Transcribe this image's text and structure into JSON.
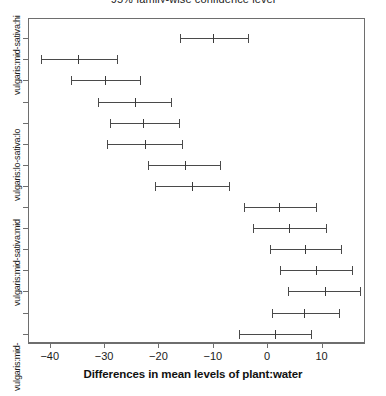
{
  "chart_data": {
    "type": "bar",
    "subtype": "tukey-hsd-confidence-intervals",
    "title": "95% family-wise confidence level",
    "xlabel": "Differences in mean levels of plant:water",
    "ylabel": "",
    "xlim": [
      -44,
      18
    ],
    "xticks": [
      -40,
      -30,
      -20,
      -10,
      0,
      10
    ],
    "xticklabels": [
      "-40",
      "-30",
      "-20",
      "-10",
      "0",
      "10"
    ],
    "grid": false,
    "legend": null,
    "orientation": "horizontal",
    "reference_line": null,
    "n_rows": 15,
    "categories": [
      "vulgaris:mid-sativa:hi",
      "",
      "",
      "",
      "",
      "vulgaris:lo-sativa:lo",
      "",
      "",
      "",
      "",
      "vulgaris:mid-sativa:mid",
      "",
      "",
      "",
      "vulgaris:mid-"
    ],
    "rows": [
      {
        "label": "vulgaris:mid-sativa:hi",
        "lower": -16.0,
        "center": -9.9,
        "upper": -3.5
      },
      {
        "label": "",
        "lower": -41.6,
        "center": -34.8,
        "upper": -27.7
      },
      {
        "label": "",
        "lower": -36.0,
        "center": -29.8,
        "upper": -23.4
      },
      {
        "label": "",
        "lower": -31.2,
        "center": -24.3,
        "upper": -17.7
      },
      {
        "label": "",
        "lower": -28.9,
        "center": -22.9,
        "upper": -16.3
      },
      {
        "label": "vulgaris:lo-sativa:lo",
        "lower": -29.4,
        "center": -22.4,
        "upper": -15.7
      },
      {
        "label": "",
        "lower": -21.9,
        "center": -15.1,
        "upper": -8.6
      },
      {
        "label": "",
        "lower": -20.7,
        "center": -13.8,
        "upper": -7.0
      },
      {
        "label": "",
        "lower": -4.3,
        "center": 2.1,
        "upper": 8.9
      },
      {
        "label": "",
        "lower": -2.6,
        "center": 4.1,
        "upper": 10.9
      },
      {
        "label": "vulgaris:mid-sativa:mid",
        "lower": 0.6,
        "center": 7.0,
        "upper": 13.5
      },
      {
        "label": "",
        "lower": 2.4,
        "center": 9.0,
        "upper": 15.6
      },
      {
        "label": "",
        "lower": 3.9,
        "center": 10.6,
        "upper": 17.0
      },
      {
        "label": "",
        "lower": 0.9,
        "center": 6.8,
        "upper": 13.2
      },
      {
        "label": "vulgaris:mid-",
        "lower": -5.2,
        "center": 1.5,
        "upper": 8.0
      }
    ],
    "axis_labels_visible": [
      "vulgaris:mid-sativa:hi",
      "vulgaris:lo-sativa:lo",
      "vulgaris:mid-sativa:mid",
      "vulgaris:mid-"
    ],
    "colors": {
      "line": "#4a4a4a",
      "frame": "#6e6e6e",
      "text": "#1b1b1b",
      "background": "#ffffff"
    }
  }
}
